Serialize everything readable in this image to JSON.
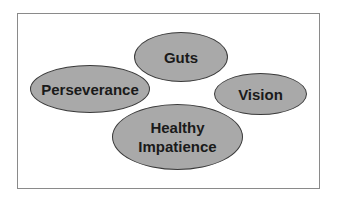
{
  "diagram": {
    "ellipses": [
      {
        "label": "Guts"
      },
      {
        "label": "Perseverance"
      },
      {
        "label": "Vision"
      },
      {
        "label": "Healthy",
        "label2": "Impatience"
      }
    ],
    "colors": {
      "fill": "#a9a9a9",
      "stroke": "#3a3a3a",
      "frame": "#8a8a8a"
    }
  }
}
